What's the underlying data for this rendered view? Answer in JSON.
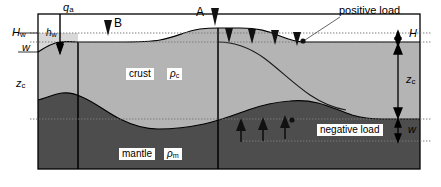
{
  "figure": {
    "colors": {
      "crust_fill": "#b3b3b3",
      "mantle_fill": "#4d4d4d",
      "water_fill": "#d4d4d4",
      "background": "#ffffff",
      "line": "#000000",
      "dotted_line": "#666666"
    }
  },
  "labels": {
    "qa": "q",
    "qa_sub": "a",
    "Hw": "H",
    "Hw_sub": "w",
    "hw": "h",
    "hw_sub": "w",
    "w_left": "w",
    "zc_left": "z",
    "zc_left_sub": "c",
    "marker_a": "A",
    "marker_b": "B",
    "crust": "crust",
    "rho_c": "ρ",
    "rho_c_sub": "c",
    "mantle": "mantle",
    "rho_m": "ρ",
    "rho_m_sub": "m",
    "positive_load": "positive load",
    "negative_load": "negative load",
    "H_right": "H",
    "zc_right": "z",
    "zc_right_sub": "c",
    "w_right": "w"
  },
  "annotations": {
    "positive_load_arrow_count": 4,
    "negative_load_arrow_count": 4,
    "positive_load_direction": "down",
    "negative_load_direction": "up"
  }
}
